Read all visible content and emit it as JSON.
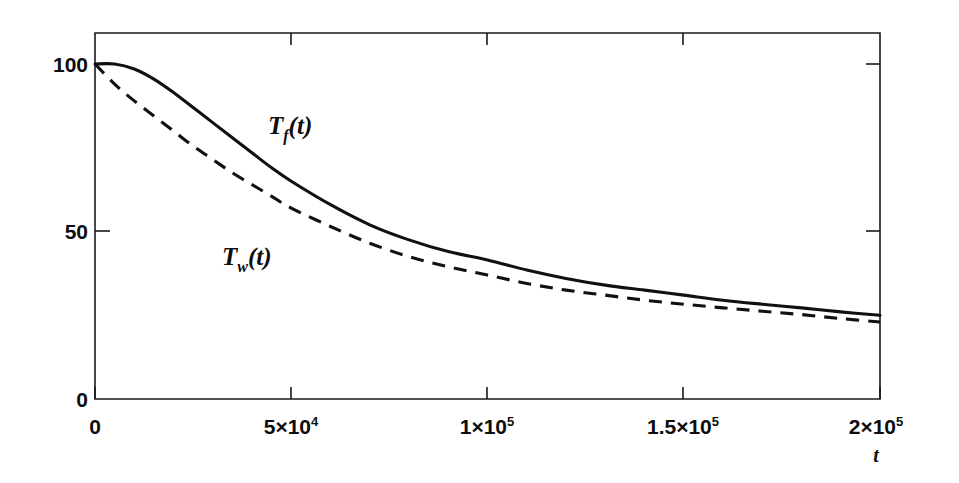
{
  "figure": {
    "background_color": "#ffffff",
    "frame_color": "#1a1a1a"
  },
  "chart_data": {
    "type": "line",
    "title": "",
    "subtitle": "",
    "xlabel": "t",
    "ylabel": "",
    "xlim": [
      0,
      200000
    ],
    "ylim": [
      0,
      112
    ],
    "grid": false,
    "legend_position": "inline-annotations",
    "x_ticks": [
      0,
      50000,
      100000,
      150000,
      200000
    ],
    "x_tick_labels": [
      "0",
      "5×10⁴",
      "1×10⁵",
      "1.5×10⁵",
      "2×10⁵"
    ],
    "y_ticks": [
      0,
      50,
      100
    ],
    "y_tick_labels": [
      "0",
      "50",
      "100"
    ],
    "x": [
      0,
      5000,
      10000,
      15000,
      20000,
      25000,
      30000,
      35000,
      40000,
      45000,
      50000,
      60000,
      70000,
      80000,
      90000,
      100000,
      110000,
      120000,
      130000,
      140000,
      150000,
      160000,
      170000,
      180000,
      190000,
      200000
    ],
    "series": [
      {
        "name": "T_f(t)",
        "label": "T",
        "sublabel": "f",
        "label_suffix": "(t)",
        "style": "solid",
        "color": "#111111",
        "values": [
          100,
          100,
          98.5,
          95.5,
          91.5,
          87,
          82.5,
          78,
          73.5,
          69,
          65,
          58,
          52,
          47.5,
          44,
          41.5,
          38.5,
          36,
          34,
          32.5,
          31,
          29.5,
          28.3,
          27.2,
          26,
          25
        ]
      },
      {
        "name": "T_w(t)",
        "label": "T",
        "sublabel": "w",
        "label_suffix": "(t)",
        "style": "dashed",
        "color": "#111111",
        "values": [
          100,
          94,
          89,
          84.5,
          80,
          75.5,
          71.5,
          67.5,
          64,
          60.5,
          57,
          51.5,
          46.5,
          42.5,
          39.5,
          37,
          34.5,
          32.5,
          31,
          29.5,
          28.3,
          27.2,
          26.2,
          25.2,
          24,
          23
        ]
      }
    ],
    "annotations": [
      {
        "name": "tf-curve-label",
        "text": "T",
        "sub": "f",
        "suffix": "(t)",
        "x": 52000,
        "y": 86
      },
      {
        "name": "tw-curve-label",
        "text": "T",
        "sub": "w",
        "suffix": "(t)",
        "x": 38000,
        "y": 47
      }
    ]
  }
}
